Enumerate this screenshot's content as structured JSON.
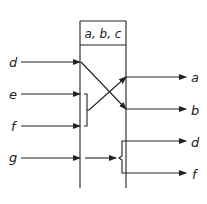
{
  "diagram": {
    "header_label": "a, b, c",
    "inputs": [
      {
        "label": "d",
        "y": 62
      },
      {
        "label": "e",
        "y": 94
      },
      {
        "label": "f",
        "y": 126
      },
      {
        "label": "g",
        "y": 158
      }
    ],
    "outputs": [
      {
        "label": "a",
        "y": 77
      },
      {
        "label": "b",
        "y": 109
      },
      {
        "label": "d",
        "y": 141
      },
      {
        "label": "f",
        "y": 173
      }
    ],
    "connections": [
      {
        "from": "d",
        "to": "b"
      },
      {
        "from": [
          "e",
          "f"
        ],
        "to": "a"
      },
      {
        "from": "g",
        "to": [
          "d",
          "f"
        ]
      }
    ],
    "colors": {
      "stroke": "#222222",
      "background": "#ffffff"
    }
  }
}
